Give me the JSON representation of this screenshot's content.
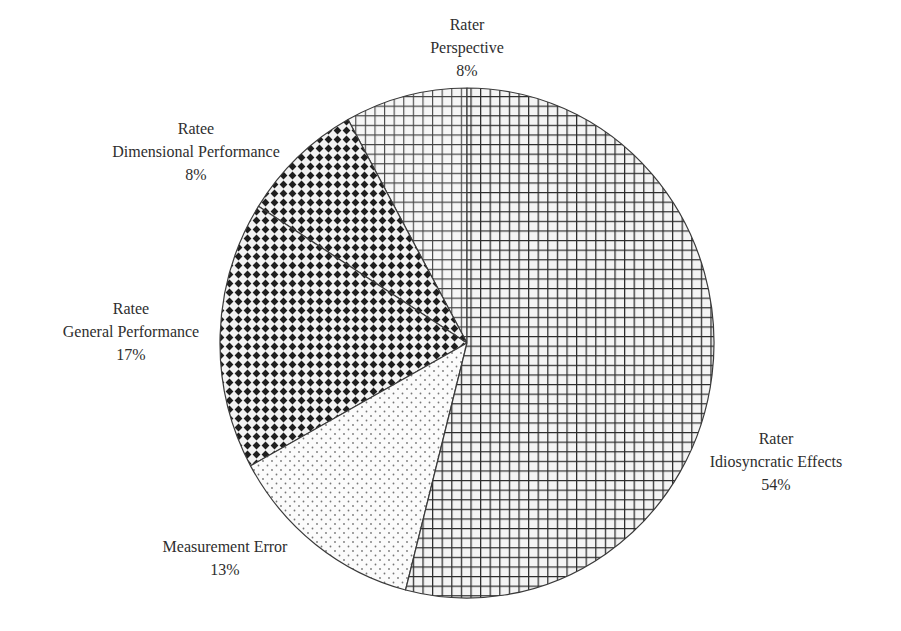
{
  "chart_data": {
    "type": "pie",
    "title": "",
    "start_angle_deg": 0,
    "direction": "counterclockwise-from-top",
    "slices": [
      {
        "label_line1": "Rater",
        "label_line2": "Perspective",
        "value": 8,
        "display": "8%",
        "pattern": "grid-light"
      },
      {
        "label_line1": "Ratee",
        "label_line2": "Dimensional Performance",
        "value": 8,
        "display": "8%",
        "pattern": "diamond-dark"
      },
      {
        "label_line1": "Ratee",
        "label_line2": "General Performance",
        "value": 17,
        "display": "17%",
        "pattern": "diamond-dark"
      },
      {
        "label_line1": "",
        "label_line2": "Measurement Error",
        "value": 13,
        "display": "13%",
        "pattern": "dots"
      },
      {
        "label_line1": "Rater",
        "label_line2": "Idiosyncratic Effects",
        "value": 54,
        "display": "54%",
        "pattern": "grid"
      }
    ],
    "categories": [
      "Rater Perspective",
      "Ratee Dimensional Performance",
      "Ratee General Performance",
      "Measurement Error",
      "Rater Idiosyncratic Effects"
    ],
    "values": [
      8,
      8,
      17,
      13,
      54
    ],
    "legend": "none (inline labels)",
    "grid": false
  },
  "colors": {
    "outline": "#3a3a3a",
    "grid_line": "#2b2b2b",
    "diamond": "#1e1e1e",
    "dot": "#777777",
    "background": "#ffffff"
  }
}
